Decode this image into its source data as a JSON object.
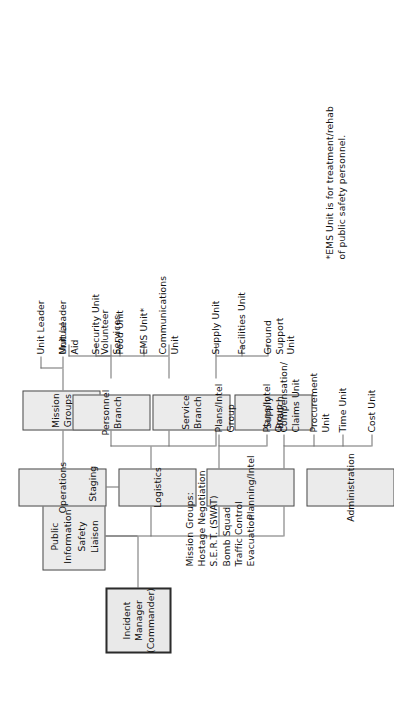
{
  "diagram": {
    "orientation": "rotated-90",
    "root": {
      "label": "Incident Manager\n(Commander)"
    },
    "staff": {
      "label": "Public Information\nSafety\nLiaison"
    },
    "sections": [
      {
        "label": "Administration",
        "children": [
          "Compensation/\nClaims Unit",
          "Procurement\nUnit",
          "Time Unit",
          "Cost Unit"
        ]
      },
      {
        "label": "Planning/Intel",
        "children": [
          "Plans/Intel\nGroup",
          "Plans/Intel\nGroup"
        ]
      },
      {
        "label": "Logistics",
        "children": [],
        "direct_child": "Staging",
        "branches": [
          {
            "label": "Supply Branch",
            "children": [
              "Supply Unit",
              "Facilities Unit",
              "Ground Support\nUnit"
            ]
          },
          {
            "label": "Service Branch",
            "children": [
              "Communications\nUnit",
              "EMS Unit*",
              "Food Unit",
              "Security Unit"
            ]
          },
          {
            "label": "Personnel Branch",
            "children": [
              "Volunteer\nServices",
              "Mutual\nAid"
            ]
          }
        ]
      },
      {
        "label": "Operations",
        "branches": [
          {
            "label": "Mission Groups",
            "children": [
              "Unit Leader",
              "Unit Leader"
            ]
          }
        ]
      }
    ],
    "mission_groups_note": "Mission Groups:\nHostage Negotiation\nS.E.R.T. (SWAT)\nBomb Squad\nTraffic Control\nEvacuation",
    "footnote": "*EMS Unit is for treatment/rehab\nof public safety personnel.",
    "colors": {
      "box_fill": "#ebebeb",
      "box_border": "#8a8a8a",
      "root_border": "#2b2b2b",
      "line": "#6f6f6f",
      "text": "#111111",
      "background": "#ffffff"
    }
  }
}
